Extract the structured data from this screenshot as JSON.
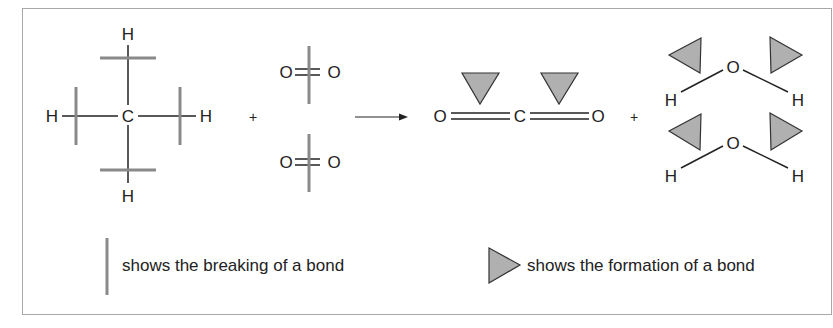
{
  "diagram": {
    "colors": {
      "bond_line": "#222222",
      "break_marker": "#8a8a8a",
      "form_marker_fill": "#b0b0b0",
      "form_marker_stroke": "#333333",
      "frame": "#a8a8a8"
    },
    "reactants": {
      "methane": {
        "name": "CH4",
        "center": "C",
        "atoms": [
          "H",
          "H",
          "H",
          "H"
        ]
      },
      "plus": "+",
      "oxygen": [
        {
          "name": "O2",
          "left": "O",
          "right": "O"
        },
        {
          "name": "O2",
          "left": "O",
          "right": "O"
        }
      ]
    },
    "arrow": "→",
    "products": {
      "carbon_dioxide": {
        "name": "CO2",
        "left": "O",
        "center": "C",
        "right": "O"
      },
      "plus": "+",
      "water": [
        {
          "name": "H2O",
          "center": "O",
          "left": "H",
          "right": "H"
        },
        {
          "name": "H2O",
          "center": "O",
          "left": "H",
          "right": "H"
        }
      ]
    },
    "legend": {
      "break_label": "shows the breaking of a bond",
      "form_label": "shows the formation of a bond"
    }
  }
}
